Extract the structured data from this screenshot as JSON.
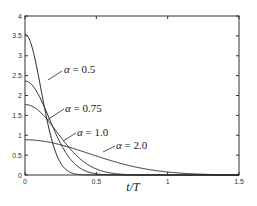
{
  "chart_data": {
    "type": "line",
    "title": "",
    "xlabel": "t/T",
    "ylabel": "",
    "xlim": [
      0,
      1.5
    ],
    "ylim": [
      0,
      4
    ],
    "grid": false,
    "legend": "inline labels with leader lines",
    "x_ticks": [
      0,
      0.5,
      1,
      1.5
    ],
    "x_tick_labels": [
      "0",
      "0.5",
      "1",
      "1.5"
    ],
    "y_ticks": [
      0,
      0.5,
      1,
      1.5,
      2,
      2.5,
      3,
      3.5,
      4
    ],
    "y_tick_labels": [
      "0",
      "0.5",
      "1",
      "1.5",
      "2",
      "2.5",
      "3",
      "3.5",
      "4"
    ],
    "formula": "y = (sqrt(pi)/alpha) * exp(-(pi*t/alpha)^2)",
    "series": [
      {
        "name": "α = 0.5",
        "alpha": 0.5,
        "x": [
          0,
          0.05,
          0.1,
          0.15,
          0.2,
          0.25,
          0.3,
          0.35,
          0.4,
          0.5
        ],
        "values": [
          3.54,
          3.21,
          2.39,
          1.45,
          0.72,
          0.3,
          0.1,
          0.03,
          0.01,
          0.0
        ],
        "label": "α = 0.5",
        "label_pos": [
          64,
          73
        ],
        "leader": [
          [
            62,
            71
          ],
          [
            48,
            80
          ]
        ]
      },
      {
        "name": "α = 0.75",
        "alpha": 0.75,
        "x": [
          0,
          0.1,
          0.2,
          0.3,
          0.4,
          0.5,
          0.6,
          0.8
        ],
        "values": [
          2.36,
          2.03,
          1.31,
          0.65,
          0.19,
          0.03,
          0.0,
          0.0
        ],
        "label": "α = 0.75",
        "label_pos": [
          65,
          112
        ],
        "leader": [
          [
            64,
            109
          ],
          [
            47,
            120
          ]
        ]
      },
      {
        "name": "α = 1.0",
        "alpha": 1.0,
        "x": [
          0,
          0.1,
          0.2,
          0.3,
          0.4,
          0.5,
          0.6,
          0.8,
          1.0
        ],
        "values": [
          1.77,
          1.61,
          1.2,
          0.72,
          0.37,
          0.15,
          0.05,
          0.0,
          0.0
        ],
        "label": "α = 1.0",
        "label_pos": [
          77,
          136
        ],
        "leader": [
          [
            76,
            133
          ],
          [
            63,
            141
          ]
        ]
      },
      {
        "name": "α = 2.0",
        "alpha": 2.0,
        "x": [
          0,
          0.2,
          0.4,
          0.6,
          0.8,
          1.0,
          1.2,
          1.5
        ],
        "values": [
          0.89,
          0.8,
          0.6,
          0.36,
          0.18,
          0.08,
          0.03,
          0.0
        ],
        "label": "α = 2.0",
        "label_pos": [
          116,
          149
        ],
        "leader": [
          [
            115,
            146
          ],
          [
            103,
            152
          ]
        ]
      }
    ]
  },
  "plot_area": {
    "left": 25,
    "top": 16,
    "right": 239,
    "bottom": 175
  },
  "colors": {
    "axis": "#333333",
    "curve": "#2a2a2a",
    "background": "#ffffff"
  }
}
